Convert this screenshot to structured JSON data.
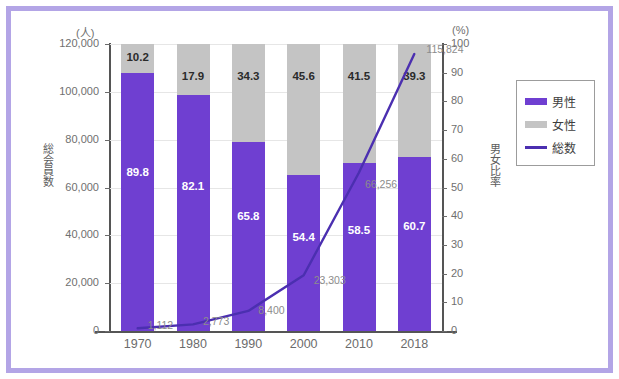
{
  "chart_data": {
    "type": "bar",
    "subtype": "stacked-bar-100-with-line-overlay",
    "title": "",
    "categories": [
      "1970",
      "1980",
      "1990",
      "2000",
      "2010",
      "2018"
    ],
    "series": [
      {
        "name": "男性",
        "unit": "%",
        "color": "#6f3fd1",
        "values": [
          89.8,
          82.1,
          65.8,
          54.4,
          58.5,
          60.7
        ]
      },
      {
        "name": "女性",
        "unit": "%",
        "color": "#c4c4c4",
        "values": [
          10.2,
          17.9,
          34.3,
          45.6,
          41.5,
          39.3
        ]
      },
      {
        "name": "総数",
        "unit": "人",
        "color": "#4b2fb0",
        "axis": "left",
        "values": [
          1112,
          2773,
          8400,
          23303,
          66256,
          115824
        ],
        "value_labels": [
          "1,112",
          "2,773",
          "8,400",
          "23,303",
          "66,256",
          "115,824"
        ]
      }
    ],
    "left_axis": {
      "title": "総会員数",
      "unit": "(人)",
      "ticks": [
        "0",
        "20,000",
        "40,000",
        "60,000",
        "80,000",
        "100,000",
        "120,000"
      ],
      "min": 0,
      "max": 120000,
      "step": 20000
    },
    "right_axis": {
      "title": "男女比率",
      "unit": "(%)",
      "ticks": [
        "0",
        "10",
        "20",
        "30",
        "40",
        "50",
        "60",
        "70",
        "80",
        "90",
        "100"
      ],
      "min": 0,
      "max": 100,
      "step": 10
    },
    "xlabel": "",
    "grid": true,
    "legend": {
      "position": "right",
      "entries": [
        {
          "label": "男性",
          "color": "#6f3fd1",
          "marker": "swatch"
        },
        {
          "label": "女性",
          "color": "#c4c4c4",
          "marker": "swatch"
        },
        {
          "label": "総数",
          "color": "#4b2fb0",
          "marker": "line"
        }
      ]
    }
  },
  "frame": {
    "border_color": "#b3a5e6",
    "background": "#ffffff"
  }
}
